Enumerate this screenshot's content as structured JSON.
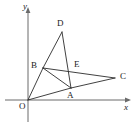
{
  "figure": {
    "type": "geometry-diagram",
    "width": 138,
    "height": 126,
    "background_color": "#ffffff",
    "line_color": "#2b2b2b",
    "axis_color": "#6b6b6b",
    "label_color": "#1a1a1a"
  },
  "axes": {
    "x_axis": {
      "label": "x",
      "label_x": 124,
      "label_y": 103,
      "start_x": 5,
      "start_y": 100,
      "end_x": 131,
      "end_y": 100,
      "arrow": "right"
    },
    "y_axis": {
      "label": "y",
      "label_x": 23,
      "label_y": 2,
      "start_x": 28,
      "start_y": 122,
      "end_x": 28,
      "end_y": 8,
      "arrow": "up"
    }
  },
  "points": [
    {
      "name": "O",
      "label": "O",
      "x": 28,
      "y": 100,
      "label_x": 19,
      "label_y": 102
    },
    {
      "name": "A",
      "label": "A",
      "x": 71,
      "y": 88,
      "label_x": 67,
      "label_y": 91
    },
    {
      "name": "B",
      "label": "B",
      "x": 43,
      "y": 68,
      "label_x": 31,
      "label_y": 61
    },
    {
      "name": "C",
      "label": "C",
      "x": 115,
      "y": 78,
      "label_x": 120,
      "label_y": 72
    },
    {
      "name": "D",
      "label": "D",
      "x": 62,
      "y": 32,
      "label_x": 57,
      "label_y": 19
    },
    {
      "name": "E",
      "label": "E",
      "x": 72,
      "y": 69,
      "label_x": 74,
      "label_y": 60
    }
  ],
  "segments": [
    {
      "name": "OB",
      "from": "O",
      "to": "B"
    },
    {
      "name": "OA",
      "from": "O",
      "to": "A"
    },
    {
      "name": "BD",
      "from": "B",
      "to": "D"
    },
    {
      "name": "BA",
      "from": "B",
      "to": "A"
    },
    {
      "name": "BC",
      "from": "B",
      "to": "C"
    },
    {
      "name": "DA",
      "from": "D",
      "to": "A"
    },
    {
      "name": "AC",
      "from": "A",
      "to": "C"
    }
  ],
  "labels": {
    "O": "O",
    "A": "A",
    "B": "B",
    "C": "C",
    "D": "D",
    "E": "E",
    "x": "x",
    "y": "y"
  }
}
